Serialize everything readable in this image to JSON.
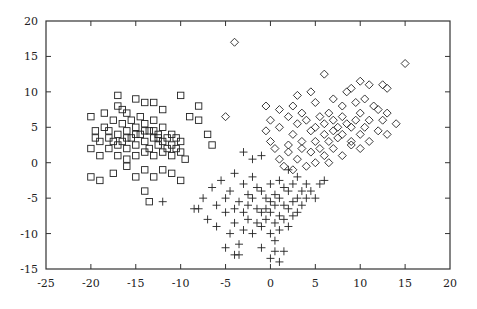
{
  "chart_data": {
    "type": "scatter",
    "title": "",
    "xlabel": "",
    "ylabel": "",
    "xlim": [
      -25,
      20
    ],
    "ylim": [
      -15,
      20
    ],
    "grid": false,
    "legend": null,
    "x_ticks": [
      "-25",
      "-20",
      "-15",
      "-10",
      "-5",
      "0",
      "5",
      "10",
      "15",
      "20"
    ],
    "y_ticks": [
      "20",
      "15",
      "10",
      "5",
      "0",
      "-5",
      "-10",
      "-15"
    ],
    "series": [
      {
        "name": "cluster-square",
        "marker": "square",
        "points": [
          [
            -20,
            6.5
          ],
          [
            -19.5,
            4.5
          ],
          [
            -19,
            3
          ],
          [
            -20,
            2
          ],
          [
            -19,
            1
          ],
          [
            -18.5,
            5
          ],
          [
            -18,
            3.5
          ],
          [
            -18,
            2
          ],
          [
            -17.5,
            6
          ],
          [
            -17,
            4
          ],
          [
            -17,
            2.5
          ],
          [
            -17,
            1
          ],
          [
            -16.5,
            5.5
          ],
          [
            -16.5,
            3
          ],
          [
            -16,
            7
          ],
          [
            -16,
            4.5
          ],
          [
            -16,
            2
          ],
          [
            -16,
            0.5
          ],
          [
            -15.5,
            6
          ],
          [
            -15.5,
            3.5
          ],
          [
            -15,
            5
          ],
          [
            -15,
            2.5
          ],
          [
            -15,
            1
          ],
          [
            -14.5,
            4
          ],
          [
            -14.5,
            6.5
          ],
          [
            -14,
            3
          ],
          [
            -14,
            1.5
          ],
          [
            -14,
            5.5
          ],
          [
            -13.5,
            4.5
          ],
          [
            -13.5,
            2
          ],
          [
            -13,
            3.5
          ],
          [
            -13,
            1
          ],
          [
            -13,
            6
          ],
          [
            -12.5,
            2.5
          ],
          [
            -12.5,
            4
          ],
          [
            -12,
            3
          ],
          [
            -12,
            1.5
          ],
          [
            -12,
            5
          ],
          [
            -11.5,
            2
          ],
          [
            -11.5,
            3.5
          ],
          [
            -11,
            2.5
          ],
          [
            -11,
            1
          ],
          [
            -10.5,
            2
          ],
          [
            -10,
            3
          ],
          [
            -10,
            1.5
          ],
          [
            -9.5,
            0.5
          ],
          [
            -17,
            9.5
          ],
          [
            -17,
            8
          ],
          [
            -15,
            9
          ],
          [
            -14,
            8.5
          ],
          [
            -13,
            8.5
          ],
          [
            -10,
            9.5
          ],
          [
            -12,
            7.5
          ],
          [
            -16.5,
            7.5
          ],
          [
            -18.5,
            7
          ],
          [
            -20,
            -2
          ],
          [
            -19,
            -2.5
          ],
          [
            -17.5,
            -1.5
          ],
          [
            -16,
            -0.5
          ],
          [
            -14,
            -4
          ],
          [
            -14,
            -1
          ],
          [
            -13,
            -2
          ],
          [
            -12,
            -1
          ],
          [
            -11,
            -1.5
          ],
          [
            -10,
            -2.5
          ],
          [
            -13.5,
            -5.5
          ],
          [
            -15,
            -2
          ],
          [
            -8,
            8
          ],
          [
            -8,
            6
          ],
          [
            -9,
            6.5
          ],
          [
            -7,
            4
          ],
          [
            -6.5,
            2.5
          ],
          [
            -19.5,
            3.5
          ],
          [
            -18,
            4.5
          ],
          [
            -17.5,
            3
          ],
          [
            -16,
            3.5
          ],
          [
            -15,
            4
          ],
          [
            -14,
            4.5
          ],
          [
            -13,
            4.5
          ],
          [
            -12.5,
            3.5
          ],
          [
            -11,
            4
          ],
          [
            -10.5,
            3.5
          ]
        ]
      },
      {
        "name": "cluster-plus",
        "marker": "plus",
        "points": [
          [
            -12,
            -5.5
          ],
          [
            -8,
            -6.5
          ],
          [
            -7.5,
            -5
          ],
          [
            -7,
            -8
          ],
          [
            -6.5,
            -3.5
          ],
          [
            -6,
            -9
          ],
          [
            -6,
            -6
          ],
          [
            -5.5,
            -2.5
          ],
          [
            -5,
            -5
          ],
          [
            -5,
            -7
          ],
          [
            -4.5,
            -10
          ],
          [
            -4.5,
            -4
          ],
          [
            -4,
            -6.5
          ],
          [
            -4,
            -8.5
          ],
          [
            -4,
            -1.5
          ],
          [
            -3.5,
            -5.5
          ],
          [
            -3.5,
            -11.5
          ],
          [
            -3,
            -3
          ],
          [
            -3,
            -7
          ],
          [
            -3,
            -9.5
          ],
          [
            -2.5,
            -4.5
          ],
          [
            -2.5,
            -6
          ],
          [
            -2.5,
            -8
          ],
          [
            -2,
            -2
          ],
          [
            -2,
            -5
          ],
          [
            -2,
            -10
          ],
          [
            -1.5,
            -3.5
          ],
          [
            -1.5,
            -6.5
          ],
          [
            -1.5,
            -8.5
          ],
          [
            -1,
            -4
          ],
          [
            -1,
            -7
          ],
          [
            -1,
            -9
          ],
          [
            -1,
            -12
          ],
          [
            -0.5,
            -5
          ],
          [
            -0.5,
            -6.5
          ],
          [
            -0.5,
            -8
          ],
          [
            0,
            -3
          ],
          [
            0,
            -5.5
          ],
          [
            0,
            -7
          ],
          [
            0,
            -10
          ],
          [
            0,
            -13.5
          ],
          [
            0.5,
            -4.5
          ],
          [
            0.5,
            -6
          ],
          [
            0.5,
            -8.5
          ],
          [
            0.5,
            -11
          ],
          [
            1,
            -2.5
          ],
          [
            1,
            -5
          ],
          [
            1,
            -7.5
          ],
          [
            1,
            -9.5
          ],
          [
            1,
            -14
          ],
          [
            1.5,
            -3.5
          ],
          [
            1.5,
            -6
          ],
          [
            1.5,
            -8
          ],
          [
            2,
            -1
          ],
          [
            2,
            -4
          ],
          [
            2,
            -6.5
          ],
          [
            2,
            -9
          ],
          [
            2.5,
            -3
          ],
          [
            2.5,
            -5.5
          ],
          [
            2.5,
            -7.5
          ],
          [
            3,
            -2
          ],
          [
            3,
            -5
          ],
          [
            3,
            -7
          ],
          [
            3.5,
            -4
          ],
          [
            3.5,
            -6
          ],
          [
            4,
            -3
          ],
          [
            4,
            -5
          ],
          [
            4.5,
            -4
          ],
          [
            5,
            -5
          ],
          [
            5.5,
            -3
          ],
          [
            6,
            -2.5
          ],
          [
            -2,
            0.5
          ],
          [
            -3,
            1.5
          ],
          [
            -1,
            1
          ],
          [
            -5,
            -12
          ],
          [
            -4,
            -13
          ],
          [
            0.5,
            -12.5
          ],
          [
            -3.5,
            -13
          ],
          [
            1.5,
            -12.5
          ],
          [
            -8.5,
            -6.5
          ]
        ]
      },
      {
        "name": "cluster-diamond",
        "marker": "diamond",
        "points": [
          [
            -4,
            17
          ],
          [
            -5,
            6.5
          ],
          [
            15,
            14
          ],
          [
            6,
            12.5
          ],
          [
            10,
            11.5
          ],
          [
            11,
            11
          ],
          [
            12.5,
            11
          ],
          [
            13,
            10.5
          ],
          [
            3,
            9.5
          ],
          [
            4.5,
            10
          ],
          [
            8.5,
            10
          ],
          [
            9,
            10.5
          ],
          [
            -0.5,
            8
          ],
          [
            1,
            7.5
          ],
          [
            2.5,
            8
          ],
          [
            3.5,
            7
          ],
          [
            5,
            8.5
          ],
          [
            7,
            9
          ],
          [
            8,
            8
          ],
          [
            9.5,
            8.5
          ],
          [
            10.5,
            9
          ],
          [
            11.5,
            8
          ],
          [
            12,
            7.5
          ],
          [
            13,
            7
          ],
          [
            0,
            6
          ],
          [
            1,
            5
          ],
          [
            2,
            6.5
          ],
          [
            2.5,
            4
          ],
          [
            3,
            5.5
          ],
          [
            3.5,
            3
          ],
          [
            4,
            6
          ],
          [
            4.5,
            4.5
          ],
          [
            5,
            5
          ],
          [
            5,
            3
          ],
          [
            5.5,
            6.5
          ],
          [
            6,
            4
          ],
          [
            6,
            5.5
          ],
          [
            6.5,
            3
          ],
          [
            6.5,
            7
          ],
          [
            7,
            4.5
          ],
          [
            7,
            6
          ],
          [
            7.5,
            3.5
          ],
          [
            7.5,
            5
          ],
          [
            8,
            4
          ],
          [
            8,
            6.5
          ],
          [
            8.5,
            5.5
          ],
          [
            9,
            3
          ],
          [
            9,
            5
          ],
          [
            9.5,
            6
          ],
          [
            10,
            4
          ],
          [
            10,
            7
          ],
          [
            10.5,
            5
          ],
          [
            11,
            3
          ],
          [
            11,
            6
          ],
          [
            12,
            4.5
          ],
          [
            12.5,
            6
          ],
          [
            13,
            4
          ],
          [
            14,
            5.5
          ],
          [
            0.5,
            2
          ],
          [
            1,
            0.5
          ],
          [
            1.5,
            -0.5
          ],
          [
            2,
            1.5
          ],
          [
            2.5,
            -1
          ],
          [
            3,
            0.5
          ],
          [
            3.5,
            2
          ],
          [
            4,
            -0.5
          ],
          [
            4.5,
            1.5
          ],
          [
            5,
            0
          ],
          [
            5.5,
            2
          ],
          [
            6,
            1
          ],
          [
            6.5,
            0
          ],
          [
            7,
            2
          ],
          [
            8,
            1
          ],
          [
            9,
            2.5
          ],
          [
            10,
            2
          ],
          [
            0,
            3
          ],
          [
            -0.5,
            4.5
          ],
          [
            2,
            2.5
          ]
        ]
      }
    ]
  }
}
